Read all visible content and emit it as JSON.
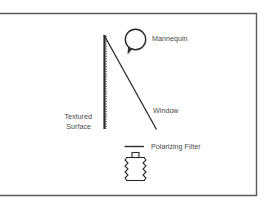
{
  "diagram": {
    "labels": {
      "mannequin": "Mannequin",
      "textured_surface_line1": "Textured",
      "textured_surface_line2": "Surface",
      "window": "Window",
      "polarizing_filter": "Polarizing Filter"
    },
    "colors": {
      "stroke": "#2b2b2b",
      "frame": "#5a5a5a",
      "text": "#4a4a4a",
      "background": "#ffffff"
    }
  }
}
